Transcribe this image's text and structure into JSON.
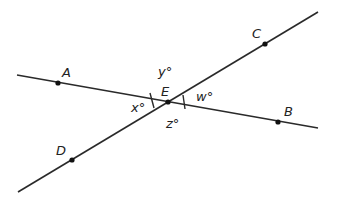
{
  "diagram": {
    "type": "intersecting-lines",
    "colors": {
      "line": "#2a2a2a",
      "point": "#111111",
      "text": "#222222"
    },
    "lines": [
      {
        "name": "AB",
        "from": [
          17,
          75
        ],
        "to": [
          318,
          128
        ]
      },
      {
        "name": "DC",
        "from": [
          18,
          192
        ],
        "to": [
          318,
          12
        ]
      }
    ],
    "points": [
      {
        "label": "A",
        "x": 58,
        "y": 83,
        "label_x": 62,
        "label_y": 77
      },
      {
        "label": "B",
        "x": 278,
        "y": 122,
        "label_x": 284,
        "label_y": 116
      },
      {
        "label": "C",
        "x": 265,
        "y": 44,
        "label_x": 252,
        "label_y": 38
      },
      {
        "label": "D",
        "x": 72,
        "y": 160,
        "label_x": 56,
        "label_y": 155
      },
      {
        "label": "E",
        "x": 168,
        "y": 102,
        "label_x": 161,
        "label_y": 96
      }
    ],
    "angles": [
      {
        "label": "y°",
        "x": 158,
        "y": 76
      },
      {
        "label": "x°",
        "x": 131,
        "y": 112
      },
      {
        "label": "w°",
        "x": 196,
        "y": 101
      },
      {
        "label": "z°",
        "x": 166,
        "y": 128
      }
    ],
    "tick_marks": [
      {
        "angle": "x",
        "x1": 150,
        "y1": 93,
        "x2": 154,
        "y2": 108
      },
      {
        "angle": "w",
        "x1": 183,
        "y1": 95,
        "x2": 185,
        "y2": 109
      }
    ]
  }
}
